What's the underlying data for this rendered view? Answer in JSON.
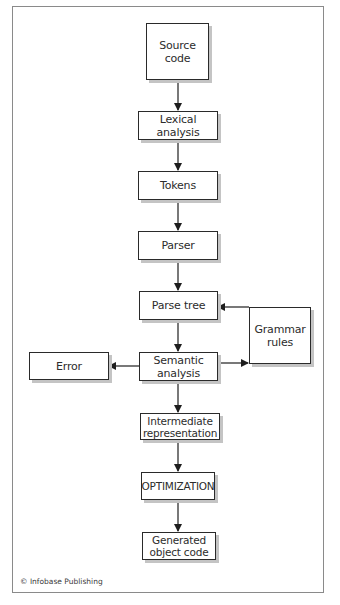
{
  "diagram": {
    "type": "flowchart",
    "nodes": {
      "source_code": "Source\ncode",
      "lexical_analysis": "Lexical analysis",
      "tokens": "Tokens",
      "parser": "Parser",
      "parse_tree": "Parse tree",
      "grammar_rules": "Grammar\nrules",
      "semantic_analysis": "Semantic\nanalysis",
      "error": "Error",
      "intermediate_representation": "Intermediate\nrepresentation",
      "optimization": "OPTIMIZATION",
      "generated_object_code": "Generated\nobject code"
    },
    "edges": [
      {
        "from": "source_code",
        "to": "lexical_analysis"
      },
      {
        "from": "lexical_analysis",
        "to": "tokens"
      },
      {
        "from": "tokens",
        "to": "parser"
      },
      {
        "from": "parser",
        "to": "parse_tree"
      },
      {
        "from": "parse_tree",
        "to": "semantic_analysis"
      },
      {
        "from": "grammar_rules",
        "to": "parse_tree"
      },
      {
        "from": "semantic_analysis",
        "to": "grammar_rules"
      },
      {
        "from": "semantic_analysis",
        "to": "error"
      },
      {
        "from": "semantic_analysis",
        "to": "intermediate_representation"
      },
      {
        "from": "intermediate_representation",
        "to": "optimization"
      },
      {
        "from": "optimization",
        "to": "generated_object_code"
      }
    ],
    "colors": {
      "line": "#1e1e1e",
      "shadow": "#c4c4c4",
      "frame": "#8a8a8a"
    }
  },
  "footer": {
    "copyright": "© Infobase Publishing"
  }
}
